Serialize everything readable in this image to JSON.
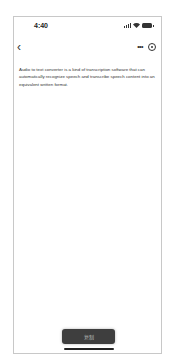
{
  "status_bar": {
    "time": "4:40"
  },
  "nav": {
    "back_icon": "chevron-left-icon",
    "more_icon": "more-dots-icon",
    "target_icon": "record-target-icon"
  },
  "content": {
    "text": "Audio to text converter is a kind of transcription software that can automatically recognize speech and transcribe speech content into an equivalent written format."
  },
  "footer": {
    "copy_label": "复制"
  }
}
